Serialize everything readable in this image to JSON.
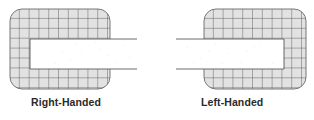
{
  "diagrams": [
    {
      "label": "Right-Handed",
      "orientation": "right",
      "description": "Rounded grid box with an opening on the right side; a white bar enters from the right."
    },
    {
      "label": "Left-Handed",
      "orientation": "left",
      "description": "Rounded grid box with an opening on the left side; a white bar enters from the left."
    }
  ],
  "colors": {
    "box_fill": "#e2e2e2",
    "grid_line": "#555555",
    "box_border": "#6a6a6a",
    "bar_fill": "#ffffff",
    "bar_line": "#6a6a6a",
    "caption": "#2a2a2a"
  }
}
